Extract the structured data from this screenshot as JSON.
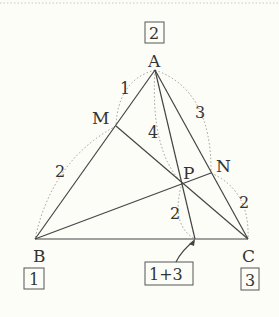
{
  "diagram": {
    "type": "geometry-triangle-mass-points",
    "colors": {
      "background": "#fdfdf8",
      "line": "#444444",
      "dotted": "#9a9a9a",
      "text": "#333333"
    },
    "points": {
      "A": {
        "label": "A",
        "x": 155,
        "y": 70
      },
      "B": {
        "label": "B",
        "x": 35,
        "y": 239
      },
      "C": {
        "label": "C",
        "x": 248,
        "y": 239
      },
      "M": {
        "label": "M",
        "x": 116,
        "y": 126
      },
      "N": {
        "label": "N",
        "x": 211,
        "y": 173
      },
      "P": {
        "label": "P",
        "x": 182,
        "y": 183
      },
      "D": {
        "label": "",
        "x": 195,
        "y": 239
      }
    },
    "segment_ratios": {
      "AM": "1",
      "MB": "2",
      "AN": "3",
      "NC": "2",
      "AP": "4",
      "PD": "2"
    },
    "mass_boxes": {
      "A": "2",
      "B": "1",
      "C": "3",
      "D": "1+3"
    }
  }
}
